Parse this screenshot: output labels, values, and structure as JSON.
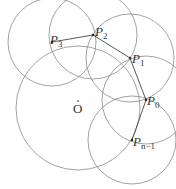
{
  "diagram": {
    "type": "geometric-construction",
    "stroke_color": "#8a8a8a",
    "main_circle": {
      "center_label": "O",
      "cx": 78,
      "cy": 108,
      "r": 62
    },
    "points": [
      {
        "id": "P3",
        "base": "P",
        "sub": "3",
        "x": 52,
        "y": 42
      },
      {
        "id": "P2",
        "base": "P",
        "sub": "2",
        "x": 93,
        "y": 35
      },
      {
        "id": "P1",
        "base": "P",
        "sub": "1",
        "x": 130,
        "y": 58
      },
      {
        "id": "P0",
        "base": "P",
        "sub": "0",
        "x": 146,
        "y": 100
      },
      {
        "id": "Pn-1",
        "base": "P",
        "sub": "n−1",
        "x": 132,
        "y": 140
      }
    ],
    "center_label": "O"
  }
}
